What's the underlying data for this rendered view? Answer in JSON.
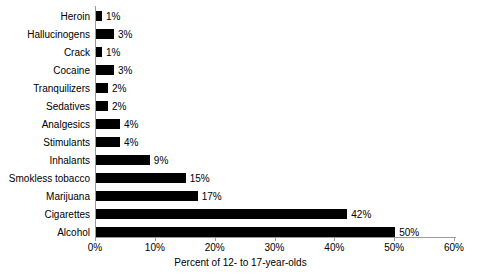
{
  "chart_data": {
    "type": "bar",
    "orientation": "horizontal",
    "title": "",
    "subtitle": "",
    "xlabel": "Percent of 12- to 17-year-olds",
    "ylabel": "",
    "xlim": [
      0,
      60
    ],
    "ylim": null,
    "grid": false,
    "legend": null,
    "legend_position": "none",
    "xticks": [
      "0%",
      "10%",
      "20%",
      "30%",
      "40%",
      "50%",
      "60%"
    ],
    "xtick_values": [
      0,
      10,
      20,
      30,
      40,
      50,
      60
    ],
    "bar_color": "#000000",
    "categories": [
      "Heroin",
      "Hallucinogens",
      "Crack",
      "Cocaine",
      "Tranquilizers",
      "Sedatives",
      "Analgesics",
      "Stimulants",
      "Inhalants",
      "Smokless tobacco",
      "Marijuana",
      "Cigarettes",
      "Alcohol"
    ],
    "values": [
      1,
      3,
      1,
      3,
      2,
      2,
      4,
      4,
      9,
      15,
      17,
      42,
      50
    ],
    "data_labels": [
      "1%",
      "3%",
      "1%",
      "3%",
      "2%",
      "2%",
      "4%",
      "4%",
      "9%",
      "15%",
      "17%",
      "42%",
      "50%"
    ]
  },
  "axis": {
    "x_title": "Percent of 12- to 17-year-olds"
  }
}
